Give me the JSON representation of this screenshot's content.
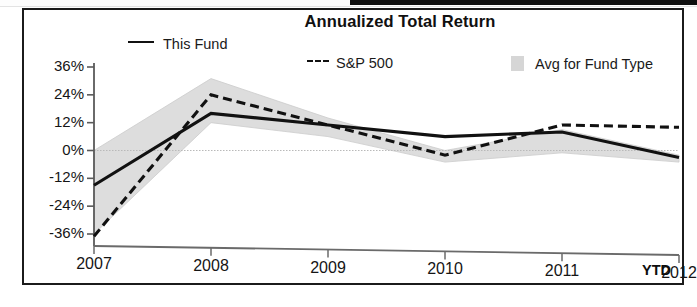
{
  "chart_data": {
    "type": "line",
    "title": "Annualized Total Return",
    "xlabel": "",
    "ylabel": "",
    "x": [
      "2007",
      "2008",
      "2009",
      "2010",
      "2011",
      "2012"
    ],
    "x_tick_labels": [
      "2007",
      "2008",
      "2009",
      "2010",
      "2011",
      "2012"
    ],
    "x_axis_suffix": "YTD",
    "y_tick_labels": [
      "36%",
      "24%",
      "12%",
      "0%",
      "-12%",
      "-24%",
      "-36%"
    ],
    "y_tick_values": [
      36,
      24,
      12,
      0,
      -12,
      -24,
      -36
    ],
    "ylim": [
      -36,
      36
    ],
    "grid": false,
    "legend_position": "top",
    "series": [
      {
        "name": "This Fund",
        "style": "solid",
        "color": "#111111",
        "values": [
          -15,
          16,
          11,
          6,
          8,
          -3
        ]
      },
      {
        "name": "S&P 500",
        "style": "dashed",
        "color": "#111111",
        "values": [
          -37,
          24,
          11,
          -2,
          11,
          10
        ]
      },
      {
        "name": "Avg for Fund Type",
        "style": "band",
        "color": "#d8d8d8",
        "upper": [
          0,
          31,
          14,
          0,
          9,
          -2
        ],
        "lower": [
          -36,
          12,
          6,
          -5,
          -1,
          -5
        ]
      }
    ]
  },
  "legend": {
    "this_fund": "This Fund",
    "sp500": "S&P 500",
    "avg_fund_type": "Avg for Fund Type"
  },
  "axis": {
    "ytd_label": "YTD"
  }
}
